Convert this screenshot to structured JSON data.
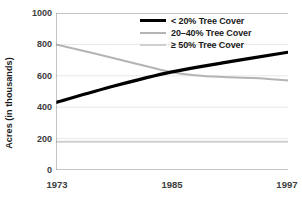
{
  "chart_data": {
    "type": "line",
    "title": "",
    "xlabel": "",
    "ylabel": "Acres (in thousands)",
    "x": [
      1973,
      1985,
      1997
    ],
    "xlim": [
      1973,
      1997
    ],
    "ylim": [
      0,
      1000
    ],
    "xticks": [
      "1973",
      "1985",
      "1997"
    ],
    "yticks": [
      "0",
      "200",
      "400",
      "600",
      "800",
      "1000"
    ],
    "ytick_values": [
      0,
      200,
      400,
      600,
      800,
      1000
    ],
    "grid": true,
    "legend_position": "top-right",
    "series": [
      {
        "name": "< 20% Tree Cover",
        "color": "#000000",
        "width": 3.2,
        "values": [
          430,
          625,
          750
        ],
        "points": [
          {
            "x": 1973,
            "y": 430
          },
          {
            "x": 1979,
            "y": 535
          },
          {
            "x": 1985,
            "y": 625
          },
          {
            "x": 1991,
            "y": 690
          },
          {
            "x": 1997,
            "y": 750
          }
        ]
      },
      {
        "name": "20–40% Tree Cover",
        "color": "#b4b4b4",
        "width": 2.0,
        "values": [
          800,
          620,
          570
        ],
        "points": [
          {
            "x": 1973,
            "y": 800
          },
          {
            "x": 1979,
            "y": 712
          },
          {
            "x": 1985,
            "y": 622
          },
          {
            "x": 1988,
            "y": 600
          },
          {
            "x": 1991,
            "y": 590
          },
          {
            "x": 1994,
            "y": 585
          },
          {
            "x": 1997,
            "y": 570
          }
        ]
      },
      {
        "name": "≥ 50% Tree Cover",
        "color": "#cfcfcf",
        "width": 2.0,
        "values": [
          180,
          180,
          180
        ],
        "points": [
          {
            "x": 1973,
            "y": 180
          },
          {
            "x": 1985,
            "y": 180
          },
          {
            "x": 1997,
            "y": 180
          }
        ]
      }
    ]
  },
  "axes": {
    "y_title": "Acres (in thousands)",
    "y_ticks": [
      "1000",
      "800",
      "600",
      "400",
      "200",
      "0"
    ],
    "x_ticks": [
      "1973",
      "1985",
      "1997"
    ]
  },
  "legend": {
    "items": [
      {
        "label": "< 20% Tree Cover",
        "swatch": "legend-line-black"
      },
      {
        "label": "20–40% Tree Cover",
        "swatch": "legend-line-gray"
      },
      {
        "label": "≥ 50% Tree Cover",
        "swatch": "legend-line-lightgray"
      }
    ]
  },
  "colors": {
    "series_1": "#000000",
    "series_2": "#b4b4b4",
    "series_3": "#cfcfcf",
    "axis": "#888888",
    "grid": "#e8e8e8",
    "text": "#3d3d3d"
  }
}
